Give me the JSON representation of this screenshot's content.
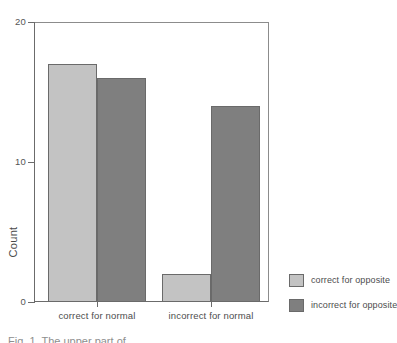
{
  "chart_data": {
    "type": "bar",
    "title": "",
    "xlabel": "",
    "ylabel": "Count",
    "ylim": [
      0,
      20
    ],
    "yticks": [
      0,
      10,
      20
    ],
    "ytick_labels": [
      "0",
      "10",
      "20"
    ],
    "grid": false,
    "legend_position": "right-bottom",
    "categories": [
      "correct for normal",
      "incorrect for normal"
    ],
    "series": [
      {
        "name": "correct for opposite",
        "color": "#c3c3c3",
        "values": [
          17,
          2
        ]
      },
      {
        "name": "incorrect for opposite",
        "color": "#7f7f7f",
        "values": [
          16,
          14
        ]
      }
    ]
  },
  "axes": {
    "y_title": "Count",
    "y_ticks": [
      {
        "label": "20",
        "value": 20
      },
      {
        "label": "10",
        "value": 10
      },
      {
        "label": "0",
        "value": 0
      }
    ],
    "x_ticks": [
      {
        "label": "correct for normal"
      },
      {
        "label": "incorrect for normal"
      }
    ]
  },
  "legend": {
    "items": [
      {
        "label": "correct for opposite",
        "color": "#c3c3c3"
      },
      {
        "label": "incorrect for opposite",
        "color": "#7f7f7f"
      }
    ]
  },
  "caption": {
    "text": "Fig. 1.  The upper part of"
  },
  "colors": {
    "light_bar": "#c3c3c3",
    "dark_bar": "#7f7f7f",
    "bar_border": "#6a6a6a",
    "axis": "#6b6b6b",
    "text": "#4d4d4d",
    "background": "#ffffff"
  }
}
